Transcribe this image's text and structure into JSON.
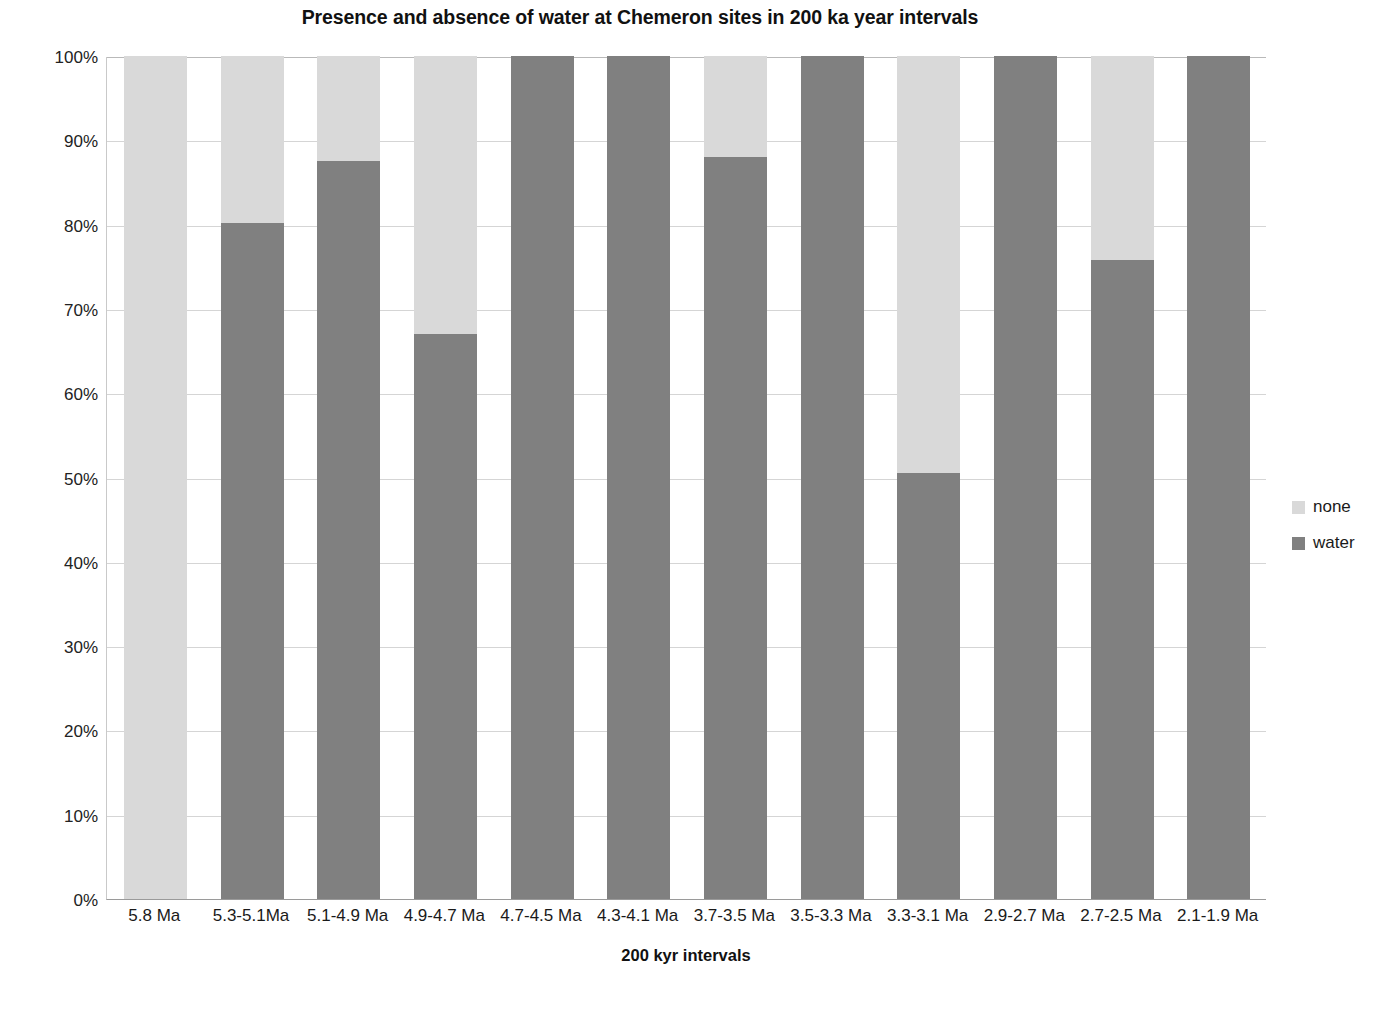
{
  "chart_data": {
    "type": "bar",
    "subtype": "stacked-percentage",
    "title": "Presence and absence of water at Chemeron sites in 200 ka year intervals",
    "xlabel": "200 kyr intervals",
    "ylabel": "Percentage of sites reconstructe with and without water",
    "categories": [
      "5.8 Ma",
      "5.3-5.1Ma",
      "5.1-4.9 Ma",
      "4.9-4.7 Ma",
      "4.7-4.5 Ma",
      "4.3-4.1 Ma",
      "3.7-3.5 Ma",
      "3.5-3.3 Ma",
      "3.3-3.1 Ma",
      "2.9-2.7 Ma",
      "2.7-2.5 Ma",
      "2.1-1.9 Ma"
    ],
    "series": [
      {
        "name": "water",
        "color": "#808080",
        "values": [
          0,
          80.2,
          87.5,
          67,
          100,
          100,
          88,
          100,
          50.5,
          100,
          75.8,
          100
        ]
      },
      {
        "name": "none",
        "color": "#d9d9d9",
        "values": [
          100,
          19.8,
          12.5,
          33,
          0,
          0,
          12,
          0,
          49.5,
          0,
          24.2,
          0
        ]
      }
    ],
    "stack_order": [
      "water",
      "none"
    ],
    "ylim": [
      0,
      100
    ],
    "ytick_labels": [
      "100%",
      "90%",
      "80%",
      "70%",
      "60%",
      "50%",
      "40%",
      "30%",
      "20%",
      "10%",
      "0%"
    ],
    "ytick_values": [
      100,
      90,
      80,
      70,
      60,
      50,
      40,
      30,
      20,
      10,
      0
    ],
    "grid": true,
    "legend_position": "right",
    "legend": [
      {
        "label": "none",
        "color": "#d9d9d9"
      },
      {
        "label": "water",
        "color": "#808080"
      }
    ]
  }
}
